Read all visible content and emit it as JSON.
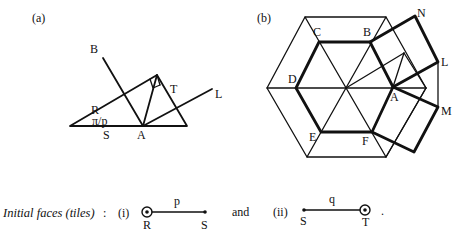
{
  "panel_a": {
    "caption": "(a)",
    "labels": {
      "B": "B",
      "R": "R",
      "angle": "π/p",
      "S": "S",
      "A": "A",
      "T": "T",
      "L": "L"
    }
  },
  "panel_b": {
    "caption": "(b)",
    "labels": {
      "C": "C",
      "B": "B",
      "N": "N",
      "L": "L",
      "D": "D",
      "A": "A",
      "M": "M",
      "E": "E",
      "F": "F"
    }
  },
  "footer": {
    "title": "Initial faces (tiles)",
    "colon": ":",
    "tile_i": {
      "index": "(i)",
      "edge_label": "p",
      "left_vertex": "R",
      "right_vertex": "S"
    },
    "conjunction": "and",
    "tile_ii": {
      "index": "(ii)",
      "edge_label": "q",
      "left_vertex": "S",
      "right_vertex": "T"
    },
    "terminator": "."
  }
}
